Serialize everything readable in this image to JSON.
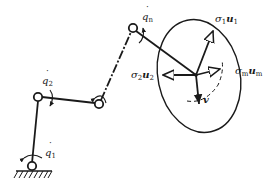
{
  "figure": {
    "colors": {
      "ink": "#1a1a1a",
      "background": "#ffffff"
    }
  },
  "labels": {
    "q1": {
      "symbol": "q",
      "sub": "1",
      "dot": "˙"
    },
    "q2": {
      "symbol": "q",
      "sub": "2",
      "dot": "˙"
    },
    "qn": {
      "symbol": "q",
      "sub": "n",
      "dot": "˙"
    },
    "sigma1u1": {
      "sigma": "σ",
      "sub1": "1",
      "vec": "u",
      "sub2": "1"
    },
    "sigma2u2": {
      "sigma": "σ",
      "sub1": "2",
      "vec": "u",
      "sub2": "2"
    },
    "sigmamum": {
      "sigma": "σ",
      "sub1": "m",
      "vec": "u",
      "sub2": "m"
    },
    "v": "v"
  }
}
